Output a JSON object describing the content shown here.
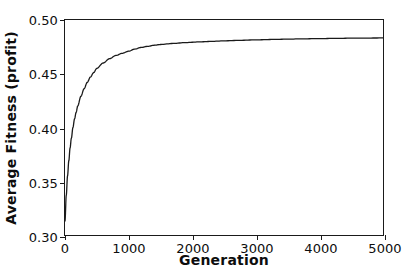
{
  "chart_data": {
    "type": "line",
    "title": "",
    "subtitle": "",
    "xlabel": "Generation",
    "ylabel": "Average Fitness (profit)",
    "xlim": [
      0,
      5000
    ],
    "ylim": [
      0.3,
      0.5
    ],
    "xticks": [
      0,
      1000,
      2000,
      3000,
      4000,
      5000
    ],
    "xtick_labels": [
      "0",
      "1000",
      "2000",
      "3000",
      "4000",
      "5000"
    ],
    "yticks": [
      0.3,
      0.35,
      0.4,
      0.45,
      0.5
    ],
    "ytick_labels": [
      "0.30",
      "0.35",
      "0.40",
      "0.45",
      "0.50"
    ],
    "grid": false,
    "legend": null,
    "legend_position": "none",
    "line_color": "#1a1a1a",
    "line_width": 1.3,
    "series": [
      {
        "name": "Average Fitness",
        "x": [
          0,
          20,
          40,
          60,
          80,
          100,
          125,
          150,
          175,
          200,
          250,
          300,
          350,
          400,
          450,
          500,
          600,
          700,
          800,
          900,
          1000,
          1100,
          1200,
          1300,
          1400,
          1500,
          1700,
          1900,
          2100,
          2300,
          2500,
          2750,
          3000,
          3250,
          3500,
          3750,
          4000,
          4250,
          4500,
          4750,
          5000
        ],
        "y": [
          0.313,
          0.337,
          0.355,
          0.369,
          0.381,
          0.39,
          0.4,
          0.408,
          0.414,
          0.42,
          0.429,
          0.436,
          0.442,
          0.447,
          0.451,
          0.455,
          0.46,
          0.464,
          0.467,
          0.469,
          0.471,
          0.473,
          0.4745,
          0.4755,
          0.4765,
          0.4772,
          0.4782,
          0.479,
          0.4796,
          0.4801,
          0.4806,
          0.4811,
          0.4815,
          0.4819,
          0.4822,
          0.4825,
          0.4827,
          0.4829,
          0.4831,
          0.4832,
          0.4833
        ]
      }
    ]
  }
}
